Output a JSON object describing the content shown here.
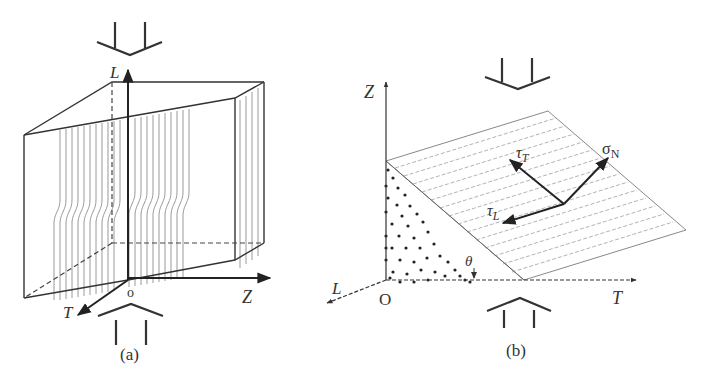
{
  "panel_a": {
    "caption": "(a)",
    "axes": {
      "vertical": "L",
      "right": "Z",
      "front": "T",
      "origin": "o"
    },
    "description": "Prism with fiber lines parallel to L axis, showing kink band under compression"
  },
  "panel_b": {
    "caption": "(b)",
    "axes": {
      "vertical": "Z",
      "front": "L",
      "right": "T",
      "origin": "O"
    },
    "stresses": {
      "normal": "σ",
      "normal_sub": "N",
      "shear_T": "τ",
      "shear_T_sub": "T",
      "shear_L": "τ",
      "shear_L_sub": "L"
    },
    "angle": "θ"
  },
  "colors": {
    "line": "#333333",
    "fiber": "#9a9a9a",
    "hatch": "#aaaaaa"
  }
}
